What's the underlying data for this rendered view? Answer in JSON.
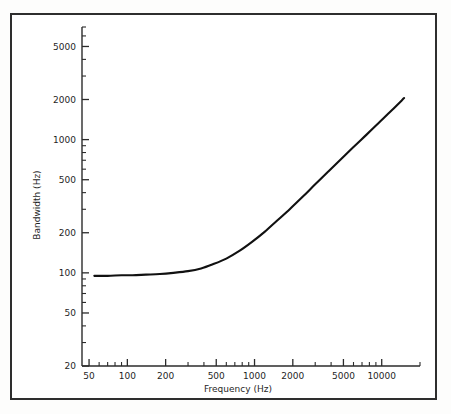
{
  "figure": {
    "background_color": "#ffffff",
    "frame_color": "#2e2e2e",
    "curve_color": "#111111"
  },
  "chart_data": {
    "type": "line",
    "title": "",
    "subtitle": "",
    "xlabel": "Frequency (Hz)",
    "ylabel": "Bandwidth (Hz)",
    "xscale": "log",
    "yscale": "log",
    "xlim": [
      44,
      20000
    ],
    "ylim": [
      20,
      7000
    ],
    "grid": false,
    "legend": null,
    "x_tick_labels": [
      "50",
      "100",
      "200",
      "500",
      "1000",
      "2000",
      "5000",
      "10000"
    ],
    "x_tick_values": [
      50,
      100,
      200,
      500,
      1000,
      2000,
      5000,
      10000
    ],
    "x_minor_tick_values": [
      60,
      70,
      80,
      90,
      300,
      400,
      600,
      700,
      800,
      900,
      3000,
      4000,
      6000,
      7000,
      8000,
      9000,
      20000
    ],
    "y_tick_labels": [
      "20",
      "50",
      "100",
      "200",
      "500",
      "1000",
      "2000",
      "5000"
    ],
    "y_tick_values": [
      20,
      50,
      100,
      200,
      500,
      1000,
      2000,
      5000
    ],
    "y_minor_tick_values": [
      30,
      40,
      60,
      70,
      80,
      90,
      300,
      400,
      600,
      700,
      800,
      900,
      3000,
      4000,
      6000,
      7000
    ],
    "series": [
      {
        "name": "Bandwidth",
        "x": [
          55,
          70,
          90,
          110,
          140,
          180,
          230,
          300,
          380,
          470,
          600,
          760,
          950,
          1200,
          1500,
          1900,
          2400,
          3000,
          3800,
          4800,
          6000,
          7600,
          9500,
          12000,
          15000
        ],
        "y": [
          95,
          95,
          96,
          96,
          97,
          98,
          100,
          103,
          108,
          116,
          128,
          146,
          170,
          203,
          246,
          302,
          374,
          462,
          576,
          714,
          880,
          1090,
          1340,
          1660,
          2050
        ]
      }
    ],
    "annotations": []
  }
}
